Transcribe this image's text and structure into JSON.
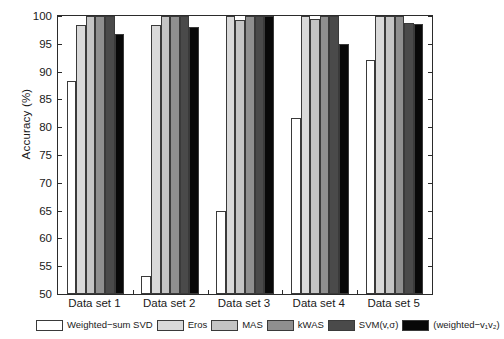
{
  "chart_data": {
    "type": "bar",
    "title": "",
    "xlabel": "",
    "ylabel": "Accuracy (%)",
    "ylim": [
      50,
      100
    ],
    "ytick_step": 5,
    "yticks": [
      50,
      55,
      60,
      65,
      70,
      75,
      80,
      85,
      90,
      95,
      100
    ],
    "grid": false,
    "legend_position": "below-axes",
    "categories": [
      "Data set 1",
      "Data set 2",
      "Data set 3",
      "Data set 4",
      "Data set 5"
    ],
    "series": [
      {
        "name": "Weighted−sum SVD",
        "color": "#ffffff",
        "values": [
          88.4,
          53.2,
          65.0,
          81.7,
          92.1
        ]
      },
      {
        "name": "Eros",
        "color": "#d9d9d9",
        "values": [
          98.3,
          98.3,
          100.0,
          100.0,
          100.0
        ]
      },
      {
        "name": "MAS",
        "color": "#c4c4c4",
        "values": [
          100.0,
          100.0,
          99.3,
          99.5,
          100.0
        ]
      },
      {
        "name": "kWAS",
        "color": "#8f8f8f",
        "values": [
          100.0,
          100.0,
          100.0,
          100.0,
          100.0
        ]
      },
      {
        "name": "SVM(v,σ)",
        "color": "#4a4a4a",
        "values": [
          100.0,
          100.0,
          100.0,
          100.0,
          98.7
        ]
      },
      {
        "name": "(weighted−v₁v₂)",
        "color": "#080808",
        "values": [
          96.7,
          98.0,
          100.0,
          95.0,
          98.6
        ]
      }
    ]
  },
  "legend": {
    "entries": [
      {
        "label": "Weighted−sum SVD",
        "color": "#ffffff"
      },
      {
        "label": "Eros",
        "color": "#d9d9d9"
      },
      {
        "label": "MAS",
        "color": "#c4c4c4"
      },
      {
        "label": "kWAS",
        "color": "#8f8f8f"
      },
      {
        "label": "SVM(v,σ)",
        "color": "#4a4a4a"
      },
      {
        "label": "(weighted−v₁v₂)",
        "color": "#080808"
      }
    ]
  },
  "axis": {
    "y_title": "Accuracy (%)"
  },
  "colors": {
    "axis": "#2b2b2b",
    "text": "#1a1a1a",
    "background": "#ffffff"
  }
}
